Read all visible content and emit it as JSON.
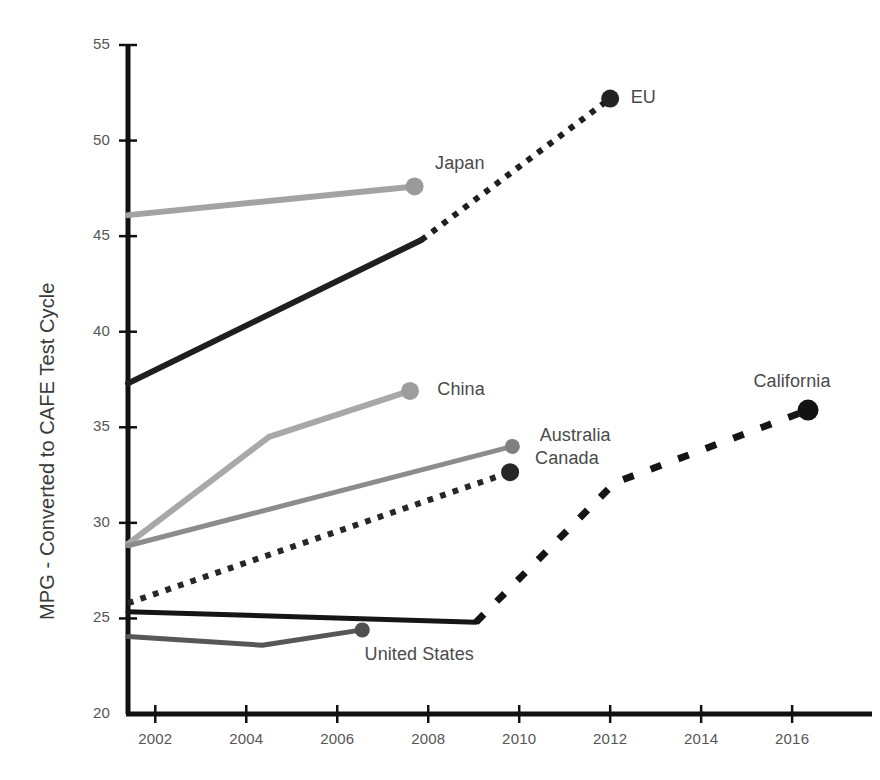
{
  "chart_data": {
    "type": "line",
    "title": "",
    "subtitle": "",
    "xlabel": "",
    "ylabel": "MPG - Converted to CAFE Test Cycle",
    "xlim": [
      2001.4,
      2017.8
    ],
    "ylim": [
      20,
      55
    ],
    "grid": false,
    "legend_position": "inline-endpoint-labels",
    "x_ticks": [
      2002,
      2004,
      2006,
      2008,
      2010,
      2012,
      2014,
      2016
    ],
    "x_tick_labels": [
      "2002",
      "2004",
      "2006",
      "2008",
      "2010",
      "2012",
      "2014",
      "2016"
    ],
    "y_ticks": [
      20,
      25,
      30,
      35,
      40,
      45,
      50,
      55
    ],
    "y_tick_labels": [
      "20",
      "25",
      "30",
      "35",
      "40",
      "45",
      "50",
      "55"
    ],
    "series": [
      {
        "name": "Japan",
        "color": "#a3a3a3",
        "width": 6,
        "style": "solid",
        "marker": true,
        "marker_color": "#9a9a9a",
        "label": "Japan",
        "label_x": 2008.15,
        "label_y": 48.7,
        "points": [
          [
            2001.4,
            46.1
          ],
          [
            2007.7,
            47.6
          ]
        ]
      },
      {
        "name": "Japan projected",
        "color": "#a3a3a3",
        "width": 6,
        "style": "none",
        "marker": false,
        "label": "",
        "points": []
      },
      {
        "name": "EU",
        "color": "#1f1f1f",
        "width": 6,
        "style": "solid",
        "marker": false,
        "label": "",
        "points": [
          [
            2001.4,
            37.3
          ],
          [
            2007.85,
            44.8
          ]
        ]
      },
      {
        "name": "EU target",
        "color": "#1f1f1f",
        "width": 6,
        "style": "dotted",
        "marker": true,
        "marker_color": "#232323",
        "label": "EU",
        "label_x": 2012.45,
        "label_y": 52.2,
        "points": [
          [
            2007.85,
            44.8
          ],
          [
            2012.0,
            52.2
          ]
        ]
      },
      {
        "name": "China",
        "color": "#a8a8a8",
        "width": 6,
        "style": "solid",
        "marker": true,
        "marker_color": "#9d9d9d",
        "label": "China",
        "label_x": 2008.2,
        "label_y": 36.9,
        "points": [
          [
            2001.4,
            28.9
          ],
          [
            2004.5,
            34.5
          ],
          [
            2007.6,
            36.9
          ]
        ]
      },
      {
        "name": "Australia",
        "color": "#8c8c8c",
        "width": 5,
        "style": "solid",
        "marker": true,
        "marker_color": "#808080",
        "label": "Australia",
        "label_x": 2010.45,
        "label_y": 34.5,
        "points": [
          [
            2001.4,
            28.8
          ],
          [
            2009.85,
            34.0
          ]
        ]
      },
      {
        "name": "Canada",
        "color": "#272727",
        "width": 6,
        "style": "dotted",
        "marker": true,
        "marker_color": "#262626",
        "label": "Canada",
        "label_x": 2010.35,
        "label_y": 33.3,
        "points": [
          [
            2001.4,
            25.8
          ],
          [
            2009.8,
            32.65
          ]
        ]
      },
      {
        "name": "United States",
        "color": "#575757",
        "width": 5,
        "style": "solid",
        "marker": true,
        "marker_color": "#4f4f4f",
        "label": "United States",
        "label_x": 2006.6,
        "label_y": 23.05,
        "points": [
          [
            2001.4,
            24.05
          ],
          [
            2004.35,
            23.6
          ],
          [
            2006.55,
            24.4
          ]
        ]
      },
      {
        "name": "California",
        "color": "#151515",
        "width": 5,
        "style": "solid",
        "marker": false,
        "label": "",
        "points": [
          [
            2001.4,
            25.35
          ],
          [
            2009.05,
            24.8
          ]
        ]
      },
      {
        "name": "California projected",
        "color": "#151515",
        "width": 7,
        "style": "dashed",
        "marker": true,
        "marker_color": "#121212",
        "label": "California",
        "label_x": 2015.15,
        "label_y": 37.3,
        "points": [
          [
            2009.05,
            24.8
          ],
          [
            2012.1,
            32.1
          ],
          [
            2016.35,
            35.9
          ]
        ]
      }
    ],
    "annotations": [
      {
        "text": "Japan",
        "x": 2008.15,
        "y": 48.7
      },
      {
        "text": "EU",
        "x": 2012.45,
        "y": 52.2
      },
      {
        "text": "China",
        "x": 2008.2,
        "y": 36.9
      },
      {
        "text": "Australia",
        "x": 2010.45,
        "y": 34.5
      },
      {
        "text": "Canada",
        "x": 2010.35,
        "y": 33.3
      },
      {
        "text": "California",
        "x": 2015.15,
        "y": 37.3
      },
      {
        "text": "United States",
        "x": 2006.6,
        "y": 23.05
      }
    ]
  },
  "axes": {
    "y_axis_title": "MPG - Converted to CAFE Test Cycle",
    "axis_color": "#111111"
  }
}
